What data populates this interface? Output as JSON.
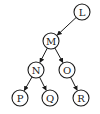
{
  "diagram": {
    "type": "binary-tree",
    "nodes": [
      {
        "id": "L",
        "label": "L",
        "x": 82,
        "y": 12
      },
      {
        "id": "M",
        "label": "M",
        "x": 51,
        "y": 41
      },
      {
        "id": "N",
        "label": "N",
        "x": 36,
        "y": 70
      },
      {
        "id": "O",
        "label": "O",
        "x": 67,
        "y": 70
      },
      {
        "id": "P",
        "label": "P",
        "x": 20,
        "y": 98
      },
      {
        "id": "Q",
        "label": "Q",
        "x": 50,
        "y": 98
      },
      {
        "id": "R",
        "label": "R",
        "x": 81,
        "y": 98
      }
    ],
    "edges": [
      {
        "from": "L",
        "to": "M"
      },
      {
        "from": "M",
        "to": "N"
      },
      {
        "from": "M",
        "to": "O"
      },
      {
        "from": "N",
        "to": "P"
      },
      {
        "from": "N",
        "to": "Q"
      },
      {
        "from": "O",
        "to": "R"
      }
    ],
    "node_radius": 8,
    "colors": {
      "stroke": "#1a1a1a",
      "fill": "#ffffff",
      "background": "#ffffff"
    }
  }
}
